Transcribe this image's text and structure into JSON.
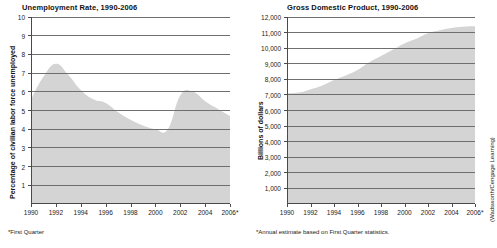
{
  "figure": {
    "credit": "(Wadsworth/Cengage Learning)",
    "background_color": "#ffffff",
    "area_fill_color": "#d4d4d4",
    "gridline_color": "#6f6f6f",
    "axis_color": "#4a4a4a"
  },
  "charts": [
    {
      "id": "unemployment",
      "title": "Unemployment Rate, 1990-2006",
      "ylabel": "Percentage of civilian labor force unemployed",
      "xlabel": "",
      "footnote": "*First Quarter",
      "ytick_labels": [
        "10",
        "9",
        "8",
        "7",
        "6",
        "5",
        "4",
        "3",
        "2",
        "1"
      ],
      "xtick_labels": [
        "1990",
        "1992",
        "1994",
        "1996",
        "1998",
        "2000",
        "2002",
        "2004",
        "2006*"
      ]
    },
    {
      "id": "gdp",
      "title": "Gross Domestic Product, 1990-2006",
      "ylabel": "Billions of dollars",
      "xlabel": "",
      "footnote": "*Annual estimate based on First Quarter statistics.",
      "ytick_labels": [
        "12,000",
        "11,000",
        "10,000",
        "9,000",
        "8,000",
        "7,000",
        "6,000",
        "5,000",
        "4,000",
        "3,000",
        "2,000",
        "1,000"
      ],
      "xtick_labels": [
        "1990",
        "1992",
        "1994",
        "1996",
        "1998",
        "2000",
        "2002",
        "2004",
        "2006*"
      ]
    }
  ],
  "chart_data": [
    {
      "type": "area",
      "title": "Unemployment Rate, 1990-2006",
      "xlabel": "",
      "ylabel": "Percentage of civilian labor force unemployed",
      "footnote": "*First Quarter",
      "grid": true,
      "legend": "none",
      "xlim": [
        1990,
        2006
      ],
      "ylim": [
        0,
        10
      ],
      "yticks": [
        1,
        2,
        3,
        4,
        5,
        6,
        7,
        8,
        9,
        10
      ],
      "xticks": [
        1990,
        1992,
        1994,
        1996,
        1998,
        2000,
        2002,
        2004,
        2006
      ],
      "x": [
        1990,
        1991,
        1992,
        1993,
        1994,
        1995,
        1996,
        1997,
        1998,
        1999,
        2000,
        2001,
        2002,
        2003,
        2004,
        2005,
        2006
      ],
      "values": [
        5.6,
        6.8,
        7.5,
        6.9,
        6.1,
        5.6,
        5.4,
        4.9,
        4.5,
        4.2,
        4.0,
        4.0,
        5.8,
        6.0,
        5.5,
        5.1,
        4.7
      ],
      "series": [
        {
          "name": "Unemployment rate (%)",
          "values": [
            5.6,
            6.8,
            7.5,
            6.9,
            6.1,
            5.6,
            5.4,
            4.9,
            4.5,
            4.2,
            4.0,
            4.0,
            5.8,
            6.0,
            5.5,
            5.1,
            4.7
          ]
        }
      ]
    },
    {
      "type": "area",
      "title": "Gross Domestic Product, 1990-2006",
      "xlabel": "",
      "ylabel": "Billions of dollars",
      "footnote": "*Annual estimate based on First Quarter statistics.",
      "grid": true,
      "legend": "none",
      "xlim": [
        1990,
        2006
      ],
      "ylim": [
        0,
        12000
      ],
      "yticks": [
        1000,
        2000,
        3000,
        4000,
        5000,
        6000,
        7000,
        8000,
        9000,
        10000,
        11000,
        12000
      ],
      "xticks": [
        1990,
        1992,
        1994,
        1996,
        1998,
        2000,
        2002,
        2004,
        2006
      ],
      "x": [
        1990,
        1991,
        1992,
        1993,
        1994,
        1995,
        1996,
        1997,
        1998,
        1999,
        2000,
        2001,
        2002,
        2003,
        2004,
        2005,
        2006
      ],
      "values": [
        7100,
        7150,
        7350,
        7600,
        7950,
        8250,
        8600,
        9100,
        9500,
        9900,
        10300,
        10600,
        10950,
        11150,
        11300,
        11380,
        11400
      ],
      "series": [
        {
          "name": "Gross Domestic Product (billions of dollars)",
          "values": [
            7100,
            7150,
            7350,
            7600,
            7950,
            8250,
            8600,
            9100,
            9500,
            9900,
            10300,
            10600,
            10950,
            11150,
            11300,
            11380,
            11400
          ]
        }
      ]
    }
  ]
}
